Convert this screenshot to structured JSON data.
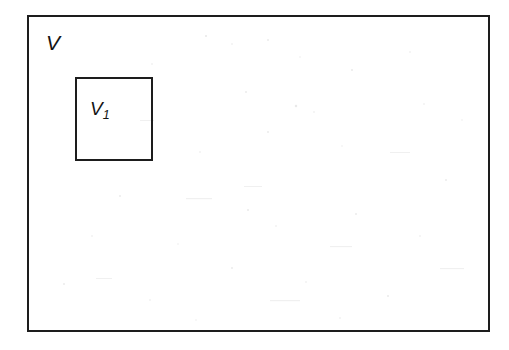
{
  "figure": {
    "type": "set-containment-diagram",
    "background_color": "#ffffff",
    "stroke_color": "#1d1d1d",
    "text_color": "#141414"
  },
  "outer_region": {
    "name": "V",
    "label": "V",
    "label_style": "italic",
    "x": 27,
    "y": 15,
    "width": 463,
    "height": 317,
    "border_width": 2
  },
  "inner_region": {
    "name": "V1",
    "label_base": "V",
    "label_subscript": "1",
    "label_style": "italic",
    "x": 102,
    "y": 92,
    "width": 78,
    "height": 84,
    "border_width": 2
  }
}
